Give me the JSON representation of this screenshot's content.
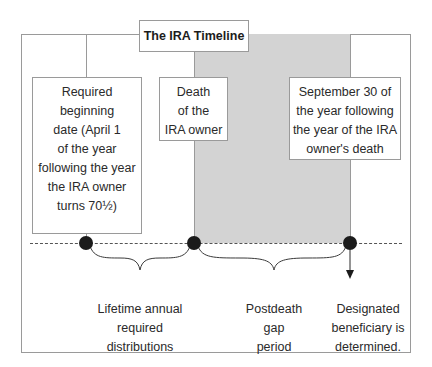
{
  "title": "The IRA Timeline",
  "events": [
    {
      "id": "required-beginning-date",
      "lines": [
        "Required",
        "beginning",
        "date (April 1",
        "of the year",
        "following the year",
        "the IRA owner",
        "turns 70½)"
      ]
    },
    {
      "id": "death-of-owner",
      "lines": [
        "Death",
        "of the",
        "IRA owner"
      ]
    },
    {
      "id": "september-30",
      "lines": [
        "September 30 of",
        "the year following",
        "the year of the IRA",
        "owner's death"
      ]
    }
  ],
  "periods": [
    {
      "id": "lifetime",
      "lines": [
        "Lifetime annual",
        "required",
        "distributions"
      ]
    },
    {
      "id": "gap",
      "lines": [
        "Postdeath",
        "gap",
        "period"
      ]
    },
    {
      "id": "beneficiary",
      "lines": [
        "Designated",
        "beneficiary is",
        "determined."
      ]
    }
  ],
  "colors": {
    "gap_shading": "#d3d3d3",
    "border": "#9a9a9a",
    "dot": "#1b1b1b"
  }
}
